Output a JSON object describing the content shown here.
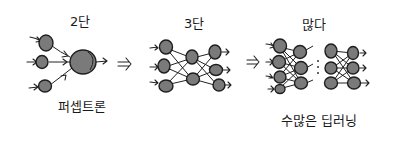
{
  "stages": [
    {
      "title": "2단",
      "caption": "퍼셉트론"
    },
    {
      "title": "3단",
      "caption": ""
    },
    {
      "title": "많다",
      "caption": "수많은 딥러닝"
    }
  ],
  "transition_arrow": "⇒",
  "colors": {
    "node_fill": "#7a7a7a",
    "stroke": "#1e1e1e",
    "background": "#ffffff"
  }
}
